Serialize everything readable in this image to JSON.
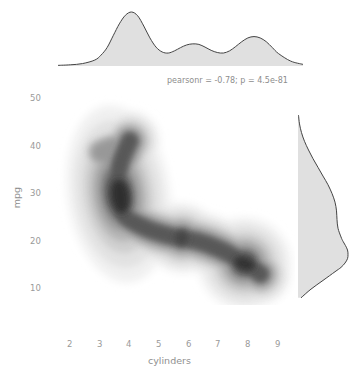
{
  "figure": {
    "type": "jointplot-kde",
    "background_color": "#ffffff",
    "annotation": "pearsonr = -0.78; p = 4.5e-81"
  },
  "chart_data": {
    "type": "heatmap",
    "title": "",
    "subtitle": "",
    "xlabel": "cylinders",
    "ylabel": "mpg",
    "annotations": [
      "pearsonr = -0.78; p = 4.5e-81"
    ],
    "grid": false,
    "legend": "none",
    "xlim": [
      1.5,
      9.6
    ],
    "ylim": [
      5.5,
      52
    ],
    "xticks": [
      2,
      3,
      4,
      5,
      6,
      7,
      8,
      9
    ],
    "xtick_labels": [
      "2",
      "3",
      "4",
      "5",
      "6",
      "7",
      "8",
      "9"
    ],
    "yticks": [
      10,
      20,
      30,
      40,
      50
    ],
    "ytick_labels": [
      "10",
      "20",
      "30",
      "40",
      "50"
    ],
    "statistics": {
      "pearsonr": -0.78,
      "p_value": "4.5e-81"
    },
    "joint_kde_modes": [
      {
        "cylinders": 4.0,
        "mpg": 29.5,
        "weight": 1.0
      },
      {
        "cylinders": 6.0,
        "mpg": 20.0,
        "weight": 0.45
      },
      {
        "cylinders": 8.0,
        "mpg": 14.5,
        "weight": 0.8
      }
    ],
    "marginal_x": {
      "variable": "cylinders",
      "type": "kde",
      "x": [
        1.6,
        2.0,
        2.4,
        2.8,
        3.0,
        3.2,
        3.4,
        3.6,
        3.8,
        4.0,
        4.2,
        4.4,
        4.6,
        4.8,
        5.0,
        5.2,
        5.4,
        5.6,
        5.8,
        6.0,
        6.2,
        6.4,
        6.6,
        6.8,
        7.0,
        7.2,
        7.4,
        7.6,
        7.8,
        8.0,
        8.2,
        8.4,
        8.6,
        8.8,
        9.2,
        9.6
      ],
      "density": [
        0.012,
        0.022,
        0.045,
        0.11,
        0.2,
        0.34,
        0.56,
        0.78,
        0.94,
        1.0,
        0.93,
        0.74,
        0.52,
        0.35,
        0.26,
        0.24,
        0.28,
        0.34,
        0.39,
        0.41,
        0.4,
        0.35,
        0.29,
        0.25,
        0.24,
        0.28,
        0.36,
        0.45,
        0.52,
        0.545,
        0.52,
        0.45,
        0.34,
        0.23,
        0.09,
        0.03
      ]
    },
    "marginal_y": {
      "variable": "mpg",
      "type": "kde",
      "y": [
        6,
        8,
        10,
        12,
        13,
        14,
        15,
        16,
        17,
        18,
        19,
        20,
        22,
        24,
        26,
        28,
        30,
        32,
        34,
        36,
        38,
        40,
        42,
        44,
        46,
        48
      ],
      "density": [
        0.06,
        0.26,
        0.5,
        0.74,
        0.86,
        0.94,
        0.99,
        1.0,
        0.99,
        0.95,
        0.9,
        0.86,
        0.8,
        0.78,
        0.77,
        0.74,
        0.68,
        0.6,
        0.5,
        0.4,
        0.3,
        0.21,
        0.13,
        0.07,
        0.03,
        0.01
      ]
    }
  },
  "axes": {
    "x_tick_labels": [
      "2",
      "3",
      "4",
      "5",
      "6",
      "7",
      "8",
      "9"
    ],
    "y_tick_labels": [
      "50",
      "40",
      "30",
      "20",
      "10"
    ],
    "x_axis_title": "cylinders",
    "y_axis_title": "mpg"
  }
}
